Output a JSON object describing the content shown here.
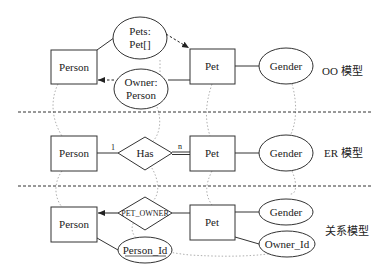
{
  "sections": [
    {
      "label": "OO 模型"
    },
    {
      "label": "ER 模型"
    },
    {
      "label": "关系模型"
    }
  ],
  "oo": {
    "person": "Person",
    "pet": "Pet",
    "gender": "Gender",
    "pets_attr_line1": "Pets:",
    "pets_attr_line2": "Pet[]",
    "owner_attr_line1": "Owner:",
    "owner_attr_line2": "Person"
  },
  "er": {
    "person": "Person",
    "relationship": "Has",
    "pet": "Pet",
    "gender": "Gender",
    "cardinality_left": "1",
    "cardinality_right": "n"
  },
  "relational": {
    "person": "Person",
    "relationship": "PET_OWNER",
    "pet": "Pet",
    "gender": "Gender",
    "owner_id": "Owner_Id",
    "person_id": "Person_Id"
  },
  "colors": {
    "stroke": "#333333",
    "dotted": "#9a9a9a",
    "divider": "#333333"
  }
}
